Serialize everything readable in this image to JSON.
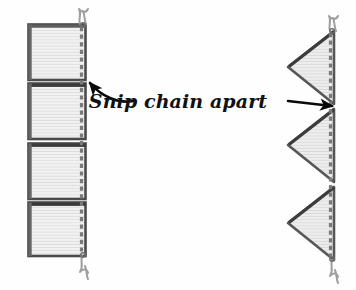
{
  "figure": {
    "title": "Snip chain apart",
    "background_color": "#fefefe",
    "caption": {
      "text": "Snip chain apart",
      "color": "#111111",
      "style": "italic",
      "x": 178,
      "y": 90
    },
    "colors": {
      "panel_fill": "#ececec",
      "panel_fill_light": "#f4f4f4",
      "panel_stroke": "#4a4a4a",
      "panel_stroke_dark": "#2e2e2e",
      "chain_stitch": "#6b6b6b",
      "thread": "#9a9a9a",
      "arrow": "#0a0a0a",
      "texture_line": "#dcdcdc"
    },
    "left_group": {
      "label": "chained-rectangles",
      "shape": "rectangle",
      "count": 4,
      "x_left": 28,
      "x_right": 86,
      "chain_x": 85,
      "panels": [
        {
          "name": "rect-panel-1",
          "y_top": 24,
          "y_bottom": 80
        },
        {
          "name": "rect-panel-2",
          "y_top": 83,
          "y_bottom": 139
        },
        {
          "name": "rect-panel-3",
          "y_top": 143,
          "y_bottom": 199
        },
        {
          "name": "rect-panel-4",
          "y_top": 202,
          "y_bottom": 256
        }
      ],
      "thread_top": {
        "x": 84,
        "y": 24
      },
      "thread_bottom": {
        "x": 84,
        "y": 256
      }
    },
    "right_group": {
      "label": "chained-triangles",
      "shape": "triangle",
      "count": 3,
      "apex_x": 288,
      "chain_x": 336,
      "panels": [
        {
          "name": "tri-panel-1",
          "y_top": 30,
          "y_bottom": 104,
          "apex_y": 67
        },
        {
          "name": "tri-panel-2",
          "y_top": 108,
          "y_bottom": 182,
          "apex_y": 145
        },
        {
          "name": "tri-panel-3",
          "y_top": 186,
          "y_bottom": 260,
          "apex_y": 223
        }
      ],
      "thread_top": {
        "x": 335,
        "y": 30
      },
      "thread_bottom": {
        "x": 335,
        "y": 260
      }
    },
    "arrows": [
      {
        "name": "arrow-to-left-chain",
        "style": "curved",
        "direction": "points-up-left",
        "tip_x": 88,
        "tip_y": 82,
        "tail_x": 133,
        "tail_y": 101
      },
      {
        "name": "arrow-to-right-chain",
        "style": "straight",
        "direction": "points-right",
        "tip_x": 336,
        "tip_y": 106,
        "tail_x": 288,
        "tail_y": 101
      }
    ]
  }
}
